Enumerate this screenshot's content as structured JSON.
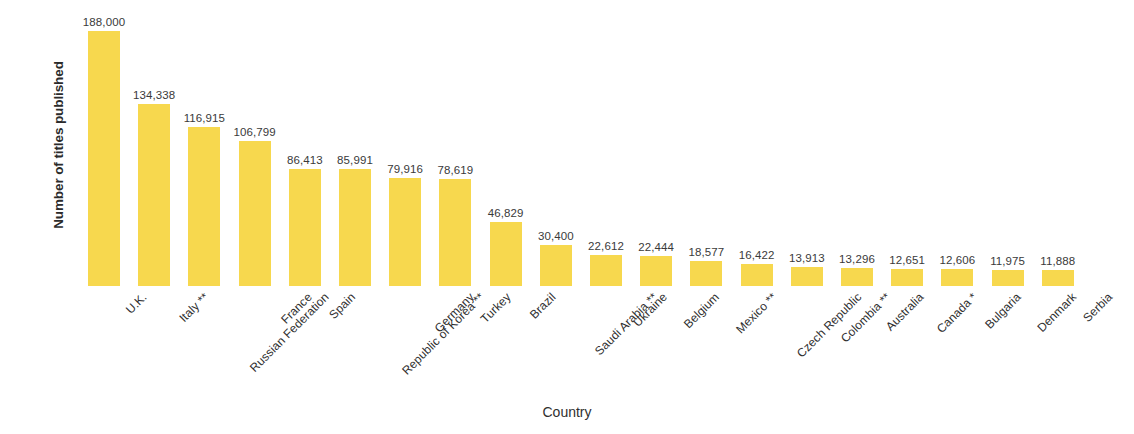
{
  "chart_data": {
    "type": "bar",
    "title": "",
    "xlabel": "Country",
    "ylabel": "Number of titles published\nin the two sectors",
    "ylabel_line1": "Number of titles published",
    "ylabel_line2": "in the two sectors",
    "grid": false,
    "legend": "none",
    "axis_ticks_visible": false,
    "bar_color": "#F7D84E",
    "data_label_color": "#3a3a3a",
    "ylim": [
      0,
      188000
    ],
    "categories": [
      "U.K.",
      "Italy **",
      "Russian Federation",
      "France",
      "Spain",
      "Republic of Korea **",
      "Germany",
      "Turkey",
      "Brazil",
      "Saudi Arabia **",
      "Ukraine",
      "Belgium",
      "Mexico **",
      "Czech Republic",
      "Colombia **",
      "Australia",
      "Canada *",
      "Bulgaria",
      "Denmark",
      "Serbia"
    ],
    "values": [
      188000,
      134338,
      116915,
      106799,
      86413,
      85991,
      79916,
      78619,
      46829,
      30400,
      22612,
      22444,
      18577,
      16422,
      13913,
      13296,
      12651,
      12606,
      11975,
      11888
    ],
    "value_labels": [
      "188,000",
      "134,338",
      "116,915",
      "106,799",
      "86,413",
      "85,991",
      "79,916",
      "78,619",
      "46,829",
      "30,400",
      "22,612",
      "22,444",
      "18,577",
      "16,422",
      "13,913",
      "13,296",
      "12,651",
      "12,606",
      "11,975",
      "11,888"
    ]
  }
}
